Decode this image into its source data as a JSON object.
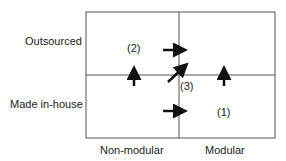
{
  "diagram": {
    "y_axis": {
      "top_label": "Outsourced",
      "bottom_label": "Made in-house"
    },
    "x_axis": {
      "left_label": "Non-modular",
      "right_label": "Modular"
    },
    "quadrant_labels": {
      "q1": "(1)",
      "q2": "(2)",
      "q3": "(3)"
    },
    "arrows": [
      {
        "name": "upper-right-arrow",
        "direction": "right",
        "from": "non-modular outsourced",
        "to": "modular outsourced"
      },
      {
        "name": "lower-right-arrow",
        "direction": "right",
        "from": "non-modular in-house",
        "to": "modular in-house"
      },
      {
        "name": "left-up-arrow",
        "direction": "up",
        "from": "non-modular in-house",
        "to": "non-modular outsourced"
      },
      {
        "name": "right-up-arrow",
        "direction": "up",
        "from": "modular in-house",
        "to": "modular outsourced"
      },
      {
        "name": "diagonal-arrow",
        "direction": "up-right",
        "from": "non-modular in-house",
        "to": "modular outsourced"
      }
    ],
    "line_color": "#555555",
    "arrow_color": "#111111"
  }
}
